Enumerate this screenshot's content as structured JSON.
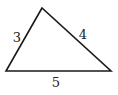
{
  "diagram": {
    "type": "triangle",
    "stroke_color": "#1a1a1a",
    "label_color": "#222222",
    "vertices": {
      "top": [
        42,
        8
      ],
      "bottom_left": [
        6,
        71
      ],
      "bottom_right": [
        111,
        71
      ]
    },
    "sides": [
      {
        "name": "left",
        "label": "3",
        "from": "bottom_left",
        "to": "top",
        "label_pos": [
          17,
          42
        ]
      },
      {
        "name": "right",
        "label": "4",
        "from": "top",
        "to": "bottom_right",
        "label_pos": [
          83,
          39
        ]
      },
      {
        "name": "bottom",
        "label": "5",
        "from": "bottom_left",
        "to": "bottom_right",
        "label_pos": [
          56,
          87
        ]
      }
    ]
  }
}
